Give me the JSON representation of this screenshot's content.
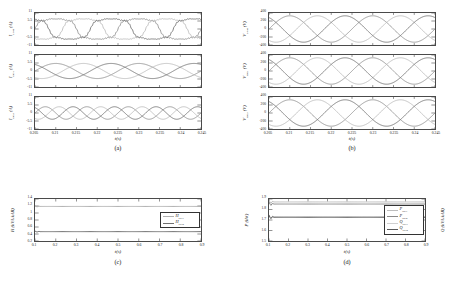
{
  "figure": {
    "background": "#ffffff",
    "captions": [
      {
        "id": "a",
        "label": "(a)"
      },
      {
        "id": "b",
        "label": "(b)"
      },
      {
        "id": "c",
        "label": "(c)"
      },
      {
        "id": "d",
        "label": "(d)"
      }
    ]
  },
  "colors": {
    "phase_a": "#8c8c8c",
    "phase_b": "#b8b8b8",
    "phase_c": "#6e6e6e",
    "dg1": "#b0b0b0",
    "dg2": "#707070",
    "p_dg1": "#bdbdbd",
    "p_dg2": "#8a8a8a",
    "q_dg1": "#d0d0d0",
    "q_dg2": "#5a5a5a",
    "axis": "#4a4a4a"
  },
  "chart_data": [
    {
      "id": "panel-a",
      "type": "line",
      "caption": "(a)",
      "xlabel": "t(s)",
      "xlim": [
        0.205,
        0.245
      ],
      "xticks": [
        "0.205",
        "0.21",
        "0.215",
        "0.22",
        "0.225",
        "0.23",
        "0.235",
        "0.24",
        "0.245"
      ],
      "xtick_values": [
        0.205,
        0.21,
        0.215,
        0.22,
        0.225,
        0.23,
        0.235,
        0.24,
        0.245
      ],
      "grid": false,
      "subplots": [
        {
          "ylabel": "I",
          "ysub": "Load",
          "yunit": "(A)",
          "ylim": [
            -11,
            11
          ],
          "yticks": [
            "11",
            "5.5",
            "0",
            "-5.5",
            "-11"
          ],
          "ytick_values": [
            11,
            5.5,
            0,
            -5.5,
            -11
          ],
          "waveform": "three-phase-distorted",
          "amplitude": 9.5,
          "frequency_hz": 50,
          "series": [
            {
              "name": "phase a",
              "phase_deg": 0
            },
            {
              "name": "phase b",
              "phase_deg": -120
            },
            {
              "name": "phase c",
              "phase_deg": 120
            }
          ]
        },
        {
          "ylabel": "I",
          "ysub": "DG1",
          "yunit": "(A)",
          "ylim": [
            -11,
            11
          ],
          "yticks": [
            "11",
            "5.5",
            "0",
            "-5.5",
            "-11"
          ],
          "ytick_values": [
            11,
            5.5,
            0,
            -5.5,
            -11
          ],
          "waveform": "three-phase-sine",
          "amplitude": 5.2,
          "frequency_hz": 50,
          "series": [
            {
              "name": "phase a",
              "phase_deg": 0
            },
            {
              "name": "phase b",
              "phase_deg": -120
            },
            {
              "name": "phase c",
              "phase_deg": 120
            }
          ]
        },
        {
          "ylabel": "I",
          "ysub": "DG2",
          "yunit": "(A)",
          "ylim": [
            -11,
            11
          ],
          "yticks": [
            "11",
            "5.5",
            "0",
            "-5.5",
            "-11"
          ],
          "ytick_values": [
            11,
            5.5,
            0,
            -5.5,
            -11
          ],
          "waveform": "three-phase-sine",
          "amplitude": 4.3,
          "frequency_hz": 100,
          "series": [
            {
              "name": "phase a",
              "phase_deg": 0
            },
            {
              "name": "phase b",
              "phase_deg": -120
            },
            {
              "name": "phase c",
              "phase_deg": 120
            }
          ]
        }
      ]
    },
    {
      "id": "panel-b",
      "type": "line",
      "caption": "(b)",
      "xlabel": "t(s)",
      "xlim": [
        0.205,
        0.245
      ],
      "xticks": [
        "0.205",
        "0.21",
        "0.215",
        "0.22",
        "0.225",
        "0.23",
        "0.235",
        "0.24",
        "0.245"
      ],
      "xtick_values": [
        0.205,
        0.21,
        0.215,
        0.22,
        0.225,
        0.23,
        0.235,
        0.24,
        0.245
      ],
      "grid": false,
      "subplots": [
        {
          "ylabel": "V",
          "ysub": "Load",
          "yunit": "(V)",
          "ylim": [
            -400,
            400
          ],
          "yticks": [
            "400",
            "200",
            "0",
            "-200",
            "-400"
          ],
          "ytick_values": [
            400,
            200,
            0,
            -200,
            -400
          ],
          "waveform": "three-phase-sine",
          "amplitude": 330,
          "frequency_hz": 50,
          "series": [
            {
              "name": "phase a",
              "phase_deg": 0
            },
            {
              "name": "phase b",
              "phase_deg": -120
            },
            {
              "name": "phase c",
              "phase_deg": 120
            }
          ]
        },
        {
          "ylabel": "V",
          "ysub": "DG1",
          "yunit": "(V)",
          "ylim": [
            -400,
            400
          ],
          "yticks": [
            "400",
            "200",
            "0",
            "-200",
            "-400"
          ],
          "ytick_values": [
            400,
            200,
            0,
            -200,
            -400
          ],
          "waveform": "three-phase-sine",
          "amplitude": 330,
          "frequency_hz": 50,
          "series": [
            {
              "name": "phase a",
              "phase_deg": 0
            },
            {
              "name": "phase b",
              "phase_deg": -120
            },
            {
              "name": "phase c",
              "phase_deg": 120
            }
          ]
        },
        {
          "ylabel": "V",
          "ysub": "DG2",
          "yunit": "(V)",
          "ylim": [
            -400,
            400
          ],
          "yticks": [
            "400",
            "200",
            "0",
            "-200",
            "-400"
          ],
          "ytick_values": [
            400,
            200,
            0,
            -200,
            -400
          ],
          "waveform": "three-phase-sine",
          "amplitude": 330,
          "frequency_hz": 50,
          "series": [
            {
              "name": "phase a",
              "phase_deg": 0
            },
            {
              "name": "phase b",
              "phase_deg": -120
            },
            {
              "name": "phase c",
              "phase_deg": 120
            }
          ]
        }
      ]
    },
    {
      "id": "panel-c",
      "type": "line",
      "caption": "(c)",
      "ylabel": "H",
      "yunit": "(kVA/kAR)",
      "xlabel": "t(s)",
      "xlim": [
        0.04,
        0.9
      ],
      "ylim": [
        0.1,
        1.4
      ],
      "xticks": [
        "0.1",
        "0.2",
        "0.3",
        "0.4",
        "0.5",
        "0.6",
        "0.7",
        "0.8",
        "0.9"
      ],
      "xtick_values": [
        0.1,
        0.2,
        0.3,
        0.4,
        0.5,
        0.6,
        0.7,
        0.8,
        0.9
      ],
      "yticks": [
        "1.4",
        "1.2",
        "1",
        "0.8",
        "0.6",
        "0.4",
        "0.2"
      ],
      "ytick_values": [
        1.4,
        1.2,
        1.0,
        0.8,
        0.6,
        0.4,
        0.2
      ],
      "grid": false,
      "legend_position": "center-right",
      "series": [
        {
          "name": "H",
          "sub": "DG1",
          "value": 1.17,
          "color_key": "dg1"
        },
        {
          "name": "H",
          "sub": "DG2",
          "value": 0.39,
          "color_key": "dg2"
        }
      ]
    },
    {
      "id": "panel-d",
      "type": "line",
      "caption": "(d)",
      "ylabel": "P",
      "yunit": "(kW)",
      "ylabel_right": "Q",
      "yunit_right": "(kVA/kAR)",
      "xlabel": "t(s)",
      "xlim": [
        0.04,
        0.9
      ],
      "ylim": [
        1.5,
        1.9
      ],
      "xticks": [
        "0.1",
        "0.2",
        "0.3",
        "0.4",
        "0.5",
        "0.6",
        "0.7",
        "0.8",
        "0.9"
      ],
      "xtick_values": [
        0.1,
        0.2,
        0.3,
        0.4,
        0.5,
        0.6,
        0.7,
        0.8,
        0.9
      ],
      "yticks": [
        "1.9",
        "1.8",
        "1.7",
        "1.6",
        "1.5"
      ],
      "ytick_values": [
        1.9,
        1.8,
        1.7,
        1.6,
        1.5
      ],
      "grid": false,
      "legend_position": "center-right",
      "series": [
        {
          "name": "P",
          "sub": "DG1",
          "value": 1.872,
          "color_key": "p_dg1"
        },
        {
          "name": "P",
          "sub": "DG2",
          "value": 1.852,
          "color_key": "p_dg2"
        },
        {
          "name": "Q",
          "sub": "DG1",
          "value": 1.731,
          "color_key": "q_dg1"
        },
        {
          "name": "Q",
          "sub": "DG2",
          "value": 1.726,
          "color_key": "q_dg2"
        }
      ]
    }
  ]
}
